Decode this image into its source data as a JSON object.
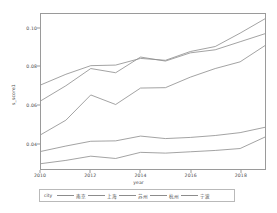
{
  "chart_data": {
    "type": "line",
    "title": "",
    "xlabel": "year",
    "ylabel": "s_score1",
    "xlim": [
      2010,
      2019
    ],
    "ylim": [
      0.0265,
      0.1075
    ],
    "grid": false,
    "legend_position": "bottom",
    "legend_title": "city",
    "xticks": [
      "2010",
      "2012",
      "2014",
      "2016",
      "2018"
    ],
    "xtick_values": [
      2010,
      2012,
      2014,
      2016,
      2018
    ],
    "yticks": [
      "0.10",
      "0.08",
      "0.06",
      "0.04"
    ],
    "ytick_values": [
      0.1,
      0.08,
      0.06,
      0.04
    ],
    "x": [
      2010,
      2011,
      2012,
      2013,
      2014,
      2015,
      2016,
      2017,
      2018,
      2019
    ],
    "series": [
      {
        "name": "南京",
        "color": "#8c8c8c",
        "values": [
          0.0705,
          0.076,
          0.0805,
          0.0808,
          0.0843,
          0.0833,
          0.0879,
          0.0905,
          0.0975,
          0.105
        ]
      },
      {
        "name": "上海",
        "color": "#8c8c8c",
        "values": [
          0.0622,
          0.07,
          0.079,
          0.0768,
          0.085,
          0.0829,
          0.0872,
          0.0888,
          0.093,
          0.0972
        ]
      },
      {
        "name": "苏州",
        "color": "#8c8c8c",
        "values": [
          0.0445,
          0.052,
          0.0652,
          0.0602,
          0.0688,
          0.069,
          0.0745,
          0.079,
          0.0825,
          0.091
        ]
      },
      {
        "name": "杭州",
        "color": "#8c8c8c",
        "values": [
          0.0357,
          0.0385,
          0.041,
          0.0412,
          0.0437,
          0.0424,
          0.043,
          0.044,
          0.0455,
          0.0483
        ]
      },
      {
        "name": "宁波",
        "color": "#8c8c8c",
        "values": [
          0.0293,
          0.031,
          0.0332,
          0.032,
          0.0352,
          0.0348,
          0.0355,
          0.0362,
          0.0372,
          0.0432
        ]
      }
    ]
  }
}
